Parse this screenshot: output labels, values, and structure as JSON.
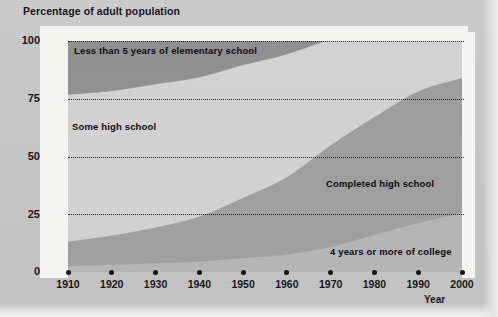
{
  "chart_data": {
    "type": "area",
    "title": "Percentage of adult population",
    "xlabel": "Year",
    "ylabel": "Percentage of adult population",
    "stacked": true,
    "grid": true,
    "legend_position": "inline-labels",
    "xlim": [
      1910,
      2000
    ],
    "ylim": [
      0,
      100
    ],
    "yticks": [
      "0",
      "25",
      "50",
      "75",
      "100"
    ],
    "ytick_values": [
      0,
      25,
      50,
      75,
      100
    ],
    "xticks": [
      "1910",
      "1920",
      "1930",
      "1940",
      "1950",
      "1960",
      "1970",
      "1980",
      "1990",
      "2000"
    ],
    "x": [
      1910,
      1920,
      1930,
      1940,
      1950,
      1960,
      1970,
      1980,
      1990,
      2000
    ],
    "series": [
      {
        "name": "4 years or more of college",
        "color": "#b4b4b4",
        "values": [
          2.7,
          3.3,
          3.9,
          4.6,
          6.2,
          7.7,
          11.0,
          16.2,
          21.3,
          25.6
        ]
      },
      {
        "name": "Completed high school",
        "color": "#9d9d9d",
        "values": [
          10.6,
          12.6,
          15.5,
          19.5,
          26.0,
          33.5,
          44.0,
          51.0,
          57.0,
          58.5
        ]
      },
      {
        "name": "Some high school",
        "color": "#d2d2d2",
        "values": [
          63.6,
          62.6,
          62.0,
          60.3,
          57.5,
          53.2,
          46.0,
          40.5,
          37.4,
          38.3
        ]
      },
      {
        "name": "Less than 5 years of elementary school",
        "color": "#8d8d8d",
        "values": [
          23.1,
          21.5,
          18.6,
          15.6,
          10.3,
          5.6,
          3.0,
          2.3,
          1.6,
          1.6
        ]
      }
    ],
    "band_labels": [
      {
        "id": "elementary",
        "text": "Less than 5 years of elementary school"
      },
      {
        "id": "some-high-school",
        "text": "Some high school"
      },
      {
        "id": "completed-high-school",
        "text": "Completed high school"
      },
      {
        "id": "college",
        "text": "4 years or more of college"
      }
    ],
    "colors": {
      "page_background": "#c8c8c8",
      "plot_background": "#d2d2d2",
      "band_dark": "#8d8d8d",
      "band_light": "#d2d2d2",
      "band_mid": "#9d9d9d",
      "band_low": "#b4b4b4",
      "gridline": "#25252a",
      "text": "#17171b"
    }
  }
}
